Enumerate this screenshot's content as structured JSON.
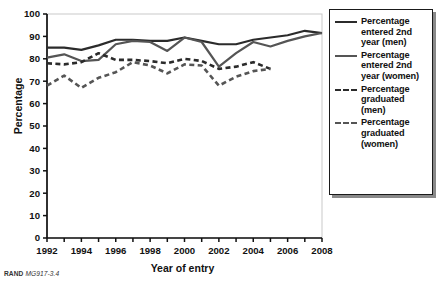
{
  "figure": {
    "credit_prefix": "RAND",
    "credit_id": "MG917-3.4"
  },
  "axes": {
    "y_title": "Percentage",
    "x_title": "Year of entry",
    "y_ticks": [
      0,
      10,
      20,
      30,
      40,
      50,
      60,
      70,
      80,
      90,
      100
    ],
    "x_ticks": [
      1992,
      1994,
      1996,
      1998,
      2000,
      2002,
      2004,
      2006,
      2008
    ]
  },
  "legend": {
    "items": [
      {
        "label": "Percentage entered 2nd year (men)",
        "style": "solid",
        "color": "#2b2b2b"
      },
      {
        "label": "Percentage entered 2nd year (women)",
        "style": "solid",
        "color": "#555555"
      },
      {
        "label": "Percentage graduated (men)",
        "style": "dashed",
        "color": "#2b2b2b"
      },
      {
        "label": "Percentage graduated (women)",
        "style": "dashed",
        "color": "#555555"
      }
    ]
  },
  "chart_data": {
    "type": "line",
    "title": "",
    "xlabel": "Year of entry",
    "ylabel": "Percentage",
    "xlim": [
      1992,
      2008
    ],
    "ylim": [
      0,
      100
    ],
    "grid": false,
    "legend_position": "right",
    "x": [
      1992,
      1993,
      1994,
      1995,
      1996,
      1997,
      1998,
      1999,
      2000,
      2001,
      2002,
      2003,
      2004,
      2005,
      2006,
      2007,
      2008
    ],
    "series": [
      {
        "name": "Percentage entered 2nd year (men)",
        "style": "solid",
        "color": "#2b2b2b",
        "values": [
          85,
          85,
          84,
          86,
          88.5,
          88.5,
          88,
          88,
          89.5,
          88,
          86.5,
          86.5,
          88.5,
          89.5,
          90.5,
          92.5,
          91.5
        ]
      },
      {
        "name": "Percentage entered 2nd year (women)",
        "style": "solid",
        "color": "#555555",
        "values": [
          80.5,
          82,
          79,
          79.5,
          86.5,
          88,
          87.5,
          83.5,
          89.5,
          87.5,
          76.5,
          82.5,
          87.5,
          85.5,
          88,
          90,
          91.5
        ]
      },
      {
        "name": "Percentage graduated (men)",
        "style": "dashed",
        "color": "#2b2b2b",
        "values": [
          78,
          77.5,
          78.5,
          82.5,
          79.5,
          79.5,
          79,
          78,
          80,
          79,
          75.5,
          76.5,
          78.5,
          75.5,
          null,
          null,
          null
        ]
      },
      {
        "name": "Percentage graduated (women)",
        "style": "dashed",
        "color": "#555555",
        "values": [
          68,
          72.5,
          67,
          71.5,
          74,
          78.5,
          77,
          73.5,
          77.5,
          77,
          68,
          72,
          74.5,
          75.5,
          null,
          null,
          null
        ]
      }
    ]
  }
}
